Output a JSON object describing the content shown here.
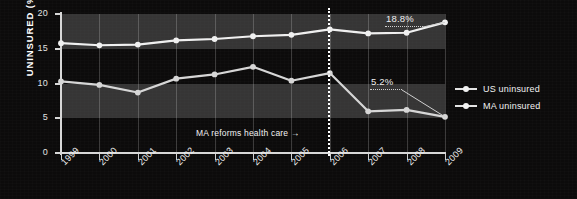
{
  "chart_data": {
    "type": "line",
    "title": "",
    "xlabel": "",
    "ylabel": "UNINSURED (%)",
    "categories": [
      "1999",
      "2000",
      "2001",
      "2002",
      "2003",
      "2004",
      "2005",
      "2006",
      "2007",
      "2008",
      "2009"
    ],
    "ylim": [
      0,
      20
    ],
    "yticks": [
      "0",
      "5",
      "10",
      "15",
      "20"
    ],
    "grid": "vertical gridlines at each year; alternating light horizontal bands 5-10 and 15-20",
    "legend_position": "right",
    "series": [
      {
        "name": "US uninsured",
        "color": "#f0f0f0",
        "values": [
          15.8,
          15.5,
          15.6,
          16.2,
          16.4,
          16.8,
          17.0,
          17.8,
          17.2,
          17.3,
          18.8
        ]
      },
      {
        "name": "MA uninsured",
        "color": "#d6d6d6",
        "values": [
          10.3,
          9.8,
          8.7,
          10.7,
          11.3,
          12.4,
          10.4,
          11.5,
          6.0,
          6.2,
          5.2
        ]
      }
    ],
    "annotations": [
      {
        "text": "18.8%",
        "series": "US uninsured",
        "year": "2009"
      },
      {
        "text": "5.2%",
        "series": "MA uninsured",
        "year": "2009"
      },
      {
        "text": "MA reforms health care  →",
        "year": "2006",
        "kind": "event-marker"
      }
    ]
  },
  "legend": {
    "items": [
      {
        "label": "US uninsured"
      },
      {
        "label": "MA uninsured"
      }
    ]
  }
}
